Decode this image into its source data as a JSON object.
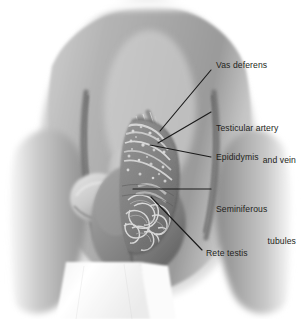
{
  "figure": {
    "background_color": "#ffffff",
    "line_color": "#1a1a1a",
    "text_color": "#231f20",
    "style": "grayscale medical airbrush illustration"
  },
  "labels": [
    {
      "id": "vas-deferens",
      "text": "Vas deferens",
      "x": 216,
      "y": 60,
      "align": "left",
      "leader": {
        "x1": 211,
        "y1": 70,
        "x2": 160,
        "y2": 131
      }
    },
    {
      "id": "testicular-artery-and-vein",
      "line1": "Testicular artery",
      "line2": "and vein",
      "x": 216,
      "y": 102,
      "align": "left",
      "leader": {
        "x1": 211,
        "y1": 112,
        "x2": 158,
        "y2": 143
      }
    },
    {
      "id": "epididymis",
      "text": "Epididymis",
      "x": 216,
      "y": 152,
      "align": "left",
      "leader": {
        "x1": 211,
        "y1": 157,
        "x2": 150,
        "y2": 145
      }
    },
    {
      "id": "seminiferous-tubules",
      "line1": "Seminiferous",
      "line2": "tubules",
      "x": 216,
      "y": 183,
      "align": "left",
      "leader": {
        "x1": 211,
        "y1": 189,
        "x2": 133,
        "y2": 189
      }
    },
    {
      "id": "rete-testis",
      "text": "Rete testis",
      "x": 206,
      "y": 248,
      "align": "left",
      "leader": {
        "x1": 202,
        "y1": 250,
        "x2": 151,
        "y2": 197
      }
    }
  ],
  "regions": [
    {
      "id": "abdomen",
      "label": "lower abdomen and thighs"
    },
    {
      "id": "penis",
      "label": "penis shaft"
    },
    {
      "id": "scrotum",
      "label": "scrotal sac"
    },
    {
      "id": "testis-cutaway",
      "label": "testis cross-section showing lobules"
    },
    {
      "id": "epididymis-body",
      "label": "epididymis"
    },
    {
      "id": "spermatic-cord",
      "label": "spermatic cord vessels"
    },
    {
      "id": "drape",
      "label": "white cloth drape"
    }
  ]
}
